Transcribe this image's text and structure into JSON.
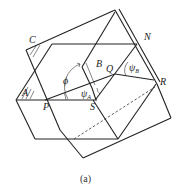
{
  "diagram": {
    "caption": "(a)",
    "labels": {
      "C": "C",
      "A": "A",
      "B": "B",
      "N": "N",
      "Q": "Q",
      "R": "R",
      "P": "P",
      "S": "S",
      "phi": "ϕ",
      "psi": "ψ",
      "sub_A": "A",
      "sub_B": "B"
    },
    "colors": {
      "line": "#222222",
      "background": "#ffffff"
    }
  }
}
